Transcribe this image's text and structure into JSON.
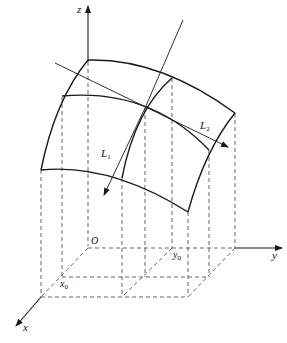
{
  "diagram": {
    "colors": {
      "line": "#1a1a1a",
      "dashed": "#555555",
      "background": "#ffffff"
    },
    "axes": {
      "z": {
        "label": "z"
      },
      "y": {
        "label": "y"
      },
      "x": {
        "label": "x"
      },
      "origin": {
        "label": "O"
      }
    },
    "points": {
      "x0": {
        "base": "x",
        "sub": "0"
      },
      "y0": {
        "base": "y",
        "sub": "0"
      }
    },
    "curves": {
      "L1": {
        "base": "L",
        "sub": "1"
      },
      "L2": {
        "base": "L",
        "sub": "2"
      }
    }
  }
}
